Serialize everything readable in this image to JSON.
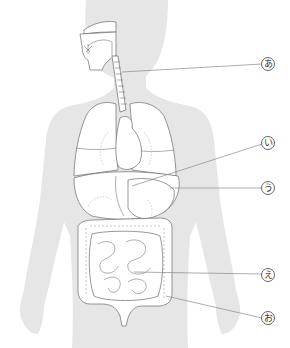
{
  "diagram": {
    "title": "",
    "colors": {
      "background": "#ffffff",
      "body_silhouette": "#e6e6e6",
      "organ_outline": "#6a6a6a",
      "leader_line": "#8a8a8a"
    },
    "labels": [
      {
        "id": "a",
        "text": "あ",
        "target": "esophagus"
      },
      {
        "id": "i",
        "text": "い",
        "target": "stomach"
      },
      {
        "id": "u",
        "text": "う",
        "target": "liver/stomach region"
      },
      {
        "id": "e",
        "text": "え",
        "target": "small intestine"
      },
      {
        "id": "o",
        "text": "お",
        "target": "large intestine"
      }
    ]
  }
}
